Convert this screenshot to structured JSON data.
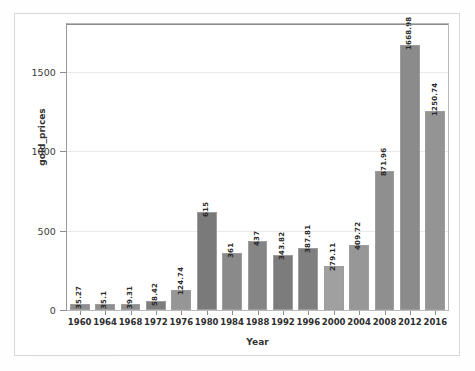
{
  "chart_data": {
    "type": "bar",
    "title": "",
    "xlabel": "Year",
    "ylabel": "gold_prices",
    "categories": [
      "1960",
      "1964",
      "1968",
      "1972",
      "1976",
      "1980",
      "1984",
      "1988",
      "1992",
      "1996",
      "2000",
      "2004",
      "2008",
      "2012",
      "2016"
    ],
    "values": [
      35.27,
      35.1,
      39.31,
      58.42,
      124.74,
      615,
      361,
      437,
      343.82,
      387.81,
      279.11,
      409.72,
      871.96,
      1668.98,
      1250.74
    ],
    "value_labels": [
      "35.27",
      "35.1",
      "39.31",
      "58.42",
      "124.74",
      "615",
      "361",
      "437",
      "343.82",
      "387.81",
      "279.11",
      "409.72",
      "871.96",
      "1668.98",
      "1250.74"
    ],
    "ylim": [
      0,
      1800
    ],
    "yticks": [
      0,
      500,
      1000,
      1500
    ],
    "ytick_labels": [
      "0",
      "500",
      "1000",
      "1500"
    ],
    "grid": true,
    "legend": "none",
    "bar_colors": [
      "#8e8e8e",
      "#8e8e8e",
      "#8e8e8e",
      "#7e7e7e",
      "#969696",
      "#7a7a7a",
      "#8a8a8a",
      "#858585",
      "#7c7c7c",
      "#7f7f7f",
      "#a0a0a0",
      "#979797",
      "#8f8f8f",
      "#8b8b8b",
      "#949494"
    ],
    "bar_edge_color": "#9d9d9d",
    "axis_color": "#8c8c8c",
    "grid_color": "#e9e9e9",
    "text_color": "#2b2b2b",
    "frame_color": "#b9b9b9"
  },
  "figure": {
    "background": "#ffffff",
    "border_color": "#d8d8d8"
  }
}
